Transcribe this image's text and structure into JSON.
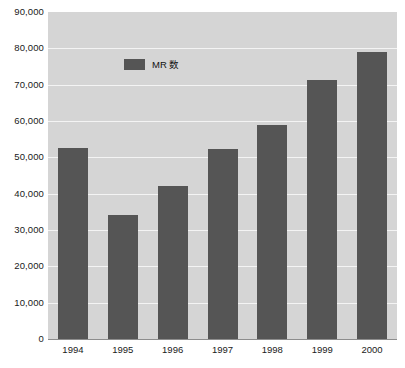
{
  "chart_data": {
    "type": "bar",
    "title": "",
    "xlabel": "",
    "ylabel": "",
    "categories": [
      "1994",
      "1995",
      "1996",
      "1997",
      "1998",
      "1999",
      "2000"
    ],
    "values": [
      52700,
      34000,
      42200,
      52200,
      58800,
      71400,
      79000
    ],
    "series": [
      {
        "name": "MR 数",
        "color": "#555555",
        "values": [
          52700,
          34000,
          42200,
          52200,
          58800,
          71400,
          79000
        ]
      }
    ],
    "ylim": [
      0,
      90000
    ],
    "ytick_step": 10000,
    "ytick_labels": [
      "90,000",
      "80,000",
      "70,000",
      "60,000",
      "50,000",
      "40,000",
      "30,000",
      "20,000",
      "10,000",
      "0"
    ],
    "ytick_values": [
      90000,
      80000,
      70000,
      60000,
      50000,
      40000,
      30000,
      20000,
      10000,
      0
    ],
    "grid": true,
    "grid_color": "#f4f4f4",
    "plot_background": "#d5d5d5",
    "legend_position": "top-left-inside"
  },
  "legend": {
    "label": "MR 数",
    "swatch_color": "#555555"
  },
  "axes": {
    "y_labels": [
      "90,000",
      "80,000",
      "70,000",
      "60,000",
      "50,000",
      "40,000",
      "30,000",
      "20,000",
      "10,000",
      "0"
    ],
    "x_labels": [
      "1994",
      "1995",
      "1996",
      "1997",
      "1998",
      "1999",
      "2000"
    ]
  }
}
